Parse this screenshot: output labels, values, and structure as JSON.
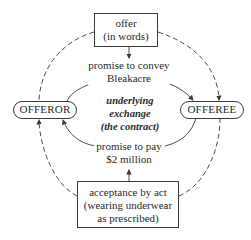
{
  "diagram": {
    "offer_box": {
      "lines": [
        "offer",
        "(in words)"
      ]
    },
    "offeror": {
      "label": "OFFEROR"
    },
    "offeree": {
      "label": "OFFEREE"
    },
    "promise_convey": {
      "lines": [
        "promise to convey",
        "Bleakacre"
      ]
    },
    "center": {
      "lines": [
        "underlying",
        "exchange",
        "(the contract)"
      ]
    },
    "promise_pay": {
      "lines": [
        "promise to pay",
        "$2 million"
      ]
    },
    "acceptance_box": {
      "lines": [
        "acceptance by act",
        "(wearing underwear",
        "as prescribed)"
      ]
    },
    "colors": {
      "stroke": "#3a3a3a",
      "text": "#2a2a2a",
      "background": "#ffffff"
    }
  }
}
